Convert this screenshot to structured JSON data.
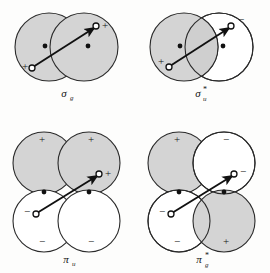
{
  "figure": {
    "background_color": "#fdfdfc",
    "lobe_positive_fill": "#d4d4d4",
    "lobe_negative_fill": "#ffffff",
    "outline_color": "#2a2a2a",
    "nucleus_color": "#111111",
    "panels": [
      {
        "id": "sigma-g",
        "label_symbol": "σ",
        "label_sub": "g",
        "label_sup": "",
        "label_full": "σg",
        "orbital_type": "sigma-bonding",
        "lobe_count": 2,
        "arrow": "internuclear-axis-arrow",
        "lobes": [
          {
            "position": "left",
            "sign": "+",
            "shaded": true
          },
          {
            "position": "right",
            "sign": "+",
            "shaded": true
          }
        ],
        "sign_labels": [
          "+",
          "+"
        ],
        "nuclei": 2
      },
      {
        "id": "sigma-u-star",
        "label_symbol": "σ",
        "label_sub": "u",
        "label_sup": "*",
        "label_full": "σ*u",
        "orbital_type": "sigma-antibonding",
        "lobe_count": 2,
        "arrow": "internuclear-axis-arrow",
        "lobes": [
          {
            "position": "left",
            "sign": "+",
            "shaded": true
          },
          {
            "position": "right",
            "sign": "−",
            "shaded": false
          }
        ],
        "sign_labels": [
          "+",
          "−"
        ],
        "nuclei": 2
      },
      {
        "id": "pi-u",
        "label_symbol": "π",
        "label_sub": "u",
        "label_sup": "",
        "label_full": "πu",
        "orbital_type": "pi-bonding",
        "lobe_count": 4,
        "arrow": "internuclear-axis-arrow",
        "lobes": [
          {
            "position": "top-left",
            "sign": "+",
            "shaded": true
          },
          {
            "position": "top-right",
            "sign": "+",
            "shaded": true
          },
          {
            "position": "bottom-left",
            "sign": "−",
            "shaded": false
          },
          {
            "position": "bottom-right",
            "sign": "−",
            "shaded": false
          }
        ],
        "sign_labels": [
          "+",
          "+",
          "−",
          "−"
        ],
        "nuclei": 2
      },
      {
        "id": "pi-g-star",
        "label_symbol": "π",
        "label_sub": "g",
        "label_sup": "*",
        "label_full": "π*g",
        "orbital_type": "pi-antibonding",
        "lobe_count": 4,
        "arrow": "internuclear-axis-arrow",
        "lobes": [
          {
            "position": "top-left",
            "sign": "+",
            "shaded": true
          },
          {
            "position": "top-right",
            "sign": "−",
            "shaded": false
          },
          {
            "position": "bottom-left",
            "sign": "−",
            "shaded": false
          },
          {
            "position": "bottom-right",
            "sign": "+",
            "shaded": true
          }
        ],
        "sign_labels": [
          "+",
          "−",
          "−",
          "+"
        ],
        "nuclei": 2
      }
    ],
    "arrow_endpoint_signs": {
      "sigma_g_tail": "+",
      "sigma_g_head": "+",
      "sigma_u_star_tail": "+",
      "sigma_u_star_head": "−",
      "pi_u_tail": "−",
      "pi_u_head": "+",
      "pi_g_star_tail": "−",
      "pi_g_star_head": "−"
    }
  }
}
